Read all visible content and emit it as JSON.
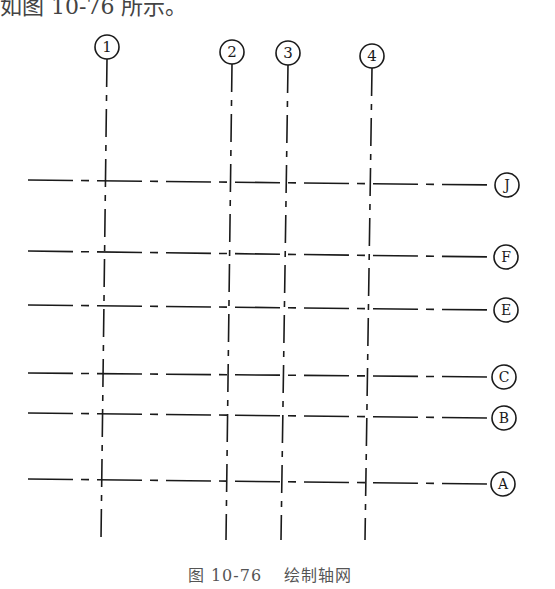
{
  "header_fragment": "如图 10-76 所示。",
  "caption": {
    "figure_no": "图 10-76",
    "title": "绘制轴网"
  },
  "vertical_axes": [
    {
      "label": "1",
      "x_top": 107,
      "x_bottom": 101,
      "circle_y": 47
    },
    {
      "label": "2",
      "x_top": 232,
      "x_bottom": 226,
      "circle_y": 52
    },
    {
      "label": "3",
      "x_top": 288,
      "x_bottom": 281,
      "circle_y": 53
    },
    {
      "label": "4",
      "x_top": 372,
      "x_bottom": 365,
      "circle_y": 56
    }
  ],
  "horizontal_axes": [
    {
      "label": "J",
      "y_left": 180,
      "y_right": 185,
      "circle_x": 507
    },
    {
      "label": "F",
      "y_left": 251,
      "y_right": 257,
      "circle_x": 506
    },
    {
      "label": "E",
      "y_left": 305,
      "y_right": 310,
      "circle_x": 506
    },
    {
      "label": "C",
      "y_left": 373,
      "y_right": 377,
      "circle_x": 504
    },
    {
      "label": "B",
      "y_left": 413,
      "y_right": 418,
      "circle_x": 504
    },
    {
      "label": "A",
      "y_left": 479,
      "y_right": 484,
      "circle_x": 503
    }
  ],
  "colors": {
    "line": "#1a1a1a",
    "text": "#333333"
  }
}
